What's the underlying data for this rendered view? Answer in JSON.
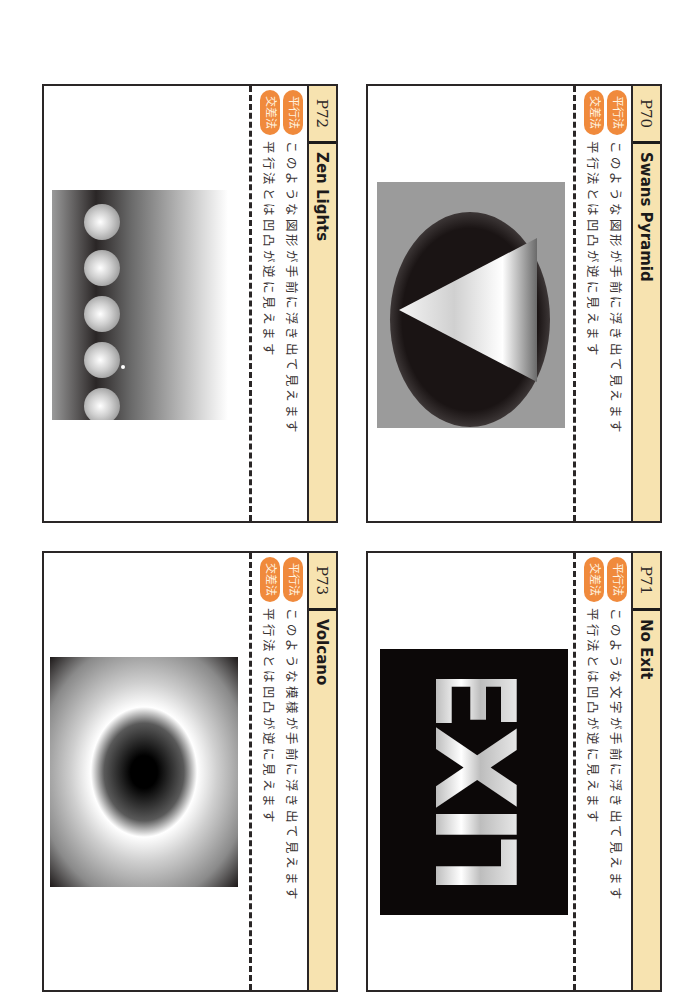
{
  "colors": {
    "header_bg": "#f7e3b0",
    "badge_bg": "#f08a3c",
    "border": "#2a2626"
  },
  "cards": [
    {
      "page": "P70",
      "title": "Swans Pyramid",
      "parallel_badge": "平行法",
      "parallel_text": "このような図形が手前に浮き出て見えます",
      "cross_badge": "交差法",
      "cross_text": "平行法とは凹凸が逆に見えます",
      "figure": "pyramid-stereogram"
    },
    {
      "page": "P71",
      "title": "No Exit",
      "parallel_badge": "平行法",
      "parallel_text": "このような文字が手前に浮き出て見えます",
      "cross_badge": "交差法",
      "cross_text": "平行法とは凹凸が逆に見えます",
      "figure": "exit-stereogram",
      "figure_word": "EXIT"
    },
    {
      "page": "P72",
      "title": "Zen Lights",
      "parallel_badge": "平行法",
      "parallel_text": "このような図形が手前に浮き出て見えます",
      "cross_badge": "交差法",
      "cross_text": "平行法とは凹凸が逆に見えます",
      "figure": "spheres-stereogram"
    },
    {
      "page": "P73",
      "title": "Volcano",
      "parallel_badge": "平行法",
      "parallel_text": "このような模様が手前に浮き出て見えます",
      "cross_badge": "交差法",
      "cross_text": "平行法とは凹凸が逆に見えます",
      "figure": "volcano-stereogram"
    }
  ]
}
